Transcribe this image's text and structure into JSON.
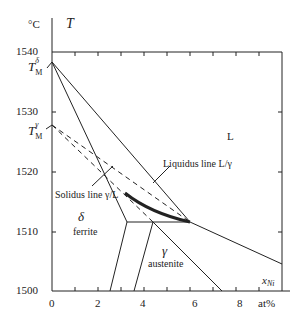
{
  "diagram": {
    "y_axis": {
      "unit": "°C",
      "symbol": "T",
      "ticks": [
        "1540",
        "1530",
        "1520",
        "1510",
        "1500"
      ]
    },
    "x_axis": {
      "unit": "at%",
      "symbol": "x",
      "symbol_sub": "Ni",
      "ticks": [
        "0",
        "2",
        "4",
        "6",
        "8"
      ]
    },
    "melting_points": [
      {
        "symbol": "T",
        "sub": "M",
        "sup": "δ",
        "value": 1538
      },
      {
        "symbol": "T",
        "sub": "M",
        "sup": "γ",
        "value": 1528
      }
    ],
    "regions": {
      "liquid": "L",
      "delta_symbol": "δ",
      "delta_name": "ferrite",
      "gamma_symbol": "γ",
      "gamma_name": "austenite"
    },
    "annotations": {
      "liquidus": "Liquidus line L/γ",
      "solidus": "Solidus line γ/L"
    },
    "colors": {
      "line": "#222222",
      "background": "#ffffff"
    }
  }
}
